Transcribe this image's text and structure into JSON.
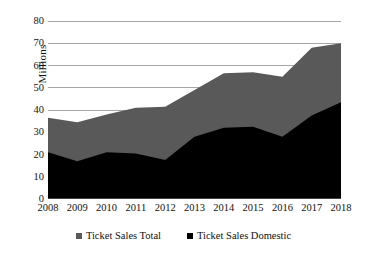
{
  "chart_data": {
    "type": "area",
    "title": "",
    "subtitle": "",
    "xlabel": "",
    "ylabel": "Millions",
    "categories": [
      "2008",
      "2009",
      "2010",
      "2011",
      "2012",
      "2013",
      "2014",
      "2015",
      "2016",
      "2017",
      "2018"
    ],
    "series": [
      {
        "name": "Ticket Sales Total",
        "color": "#595959",
        "values": [
          36.5,
          34.5,
          38.0,
          41.0,
          41.5,
          49.0,
          56.5,
          57.0,
          55.0,
          68.0,
          70.0
        ]
      },
      {
        "name": "Ticket Sales Domestic",
        "color": "#000000",
        "values": [
          21.0,
          17.0,
          21.0,
          20.5,
          17.5,
          28.0,
          32.0,
          32.5,
          28.0,
          37.5,
          43.5
        ]
      }
    ],
    "ylim": [
      0,
      80
    ],
    "yticks": [
      0,
      10,
      20,
      30,
      40,
      50,
      60,
      70,
      80
    ],
    "ytick_labels": [
      "0",
      "10",
      "20",
      "30",
      "40",
      "50",
      "60",
      "70",
      "80"
    ],
    "grid": true,
    "grid_axis": "y",
    "grid_color": "#a6a6a6",
    "axis_color": "#868686",
    "legend_position": "bottom",
    "stacked_overlay": true,
    "background": "#ffffff"
  },
  "legend": {
    "items": [
      {
        "label": "Ticket Sales Total",
        "marker": "square-marker",
        "color": "#595959"
      },
      {
        "label": "Ticket Sales Domestic",
        "marker": "square-marker",
        "color": "#000000"
      }
    ]
  }
}
